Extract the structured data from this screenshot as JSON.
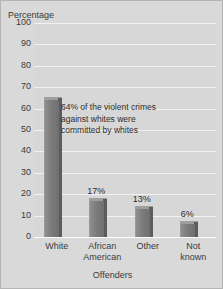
{
  "chart_data": {
    "type": "bar",
    "title": "",
    "subtitle": "",
    "xlabel": "Offenders",
    "ylabel": "Percentage",
    "categories": [
      "White",
      "African American",
      "Other",
      "Not known"
    ],
    "category_lines": [
      [
        "White"
      ],
      [
        "African",
        "American"
      ],
      [
        "Other"
      ],
      [
        "Not",
        "known"
      ]
    ],
    "values": [
      64,
      17,
      13,
      6
    ],
    "data_labels": [
      "",
      "17%",
      "13%",
      "6%"
    ],
    "ylim": [
      0,
      100
    ],
    "yticks": [
      100,
      90,
      80,
      70,
      60,
      50,
      40,
      30,
      20,
      10,
      0
    ],
    "ytick_labels": [
      "100",
      "90",
      "80",
      "70",
      "60",
      "50",
      "40",
      "30",
      "20",
      "10",
      "0"
    ],
    "grid": true,
    "grid_color": "#f2f2f2",
    "legend": false,
    "legend_position": "none",
    "bar_color": "#7c7c7c",
    "bar_side_color": "#5c5c5c",
    "bar_top_color": "#9e9e9e",
    "plot_background": "#d7d7d7",
    "figure_background": "#d9d9d9",
    "border_color": "#b4b4b4",
    "text_color": "#3b3b3b",
    "annotations": [
      {
        "lines": [
          "64% of the violent crimes",
          "against whites were",
          "committed by whites"
        ]
      }
    ]
  }
}
